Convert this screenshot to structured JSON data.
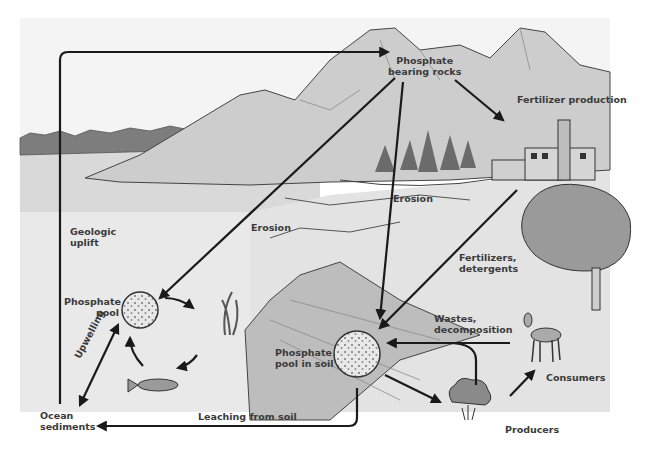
{
  "colors": {
    "sky": "#f3f3f3",
    "water": "#dcdcdc",
    "land": "#e6e6e6",
    "mountain": "#cfcfcf",
    "forest": "#7a7a7a",
    "arrow": "#1a1a1a",
    "text": "#3a3a3a"
  },
  "labels": {
    "phosphate_rocks": "Phosphate\nbearing rocks",
    "phosphate_rocks_l1": "Phosphate",
    "phosphate_rocks_l2": "bearing rocks",
    "fertilizer_production": "Fertilizer production",
    "erosion_left": "Erosion",
    "erosion_center": "Erosion",
    "geologic_uplift_l1": "Geologic",
    "geologic_uplift_l2": "uplift",
    "fertilizers_l1": "Fertilizers,",
    "fertilizers_l2": "detergents",
    "phosphate_pool_l1": "Phosphate",
    "phosphate_pool_l2": "pool",
    "phosphate_soil_l1": "Phosphate",
    "phosphate_soil_l2": "pool in soil",
    "wastes_l1": "Wastes,",
    "wastes_l2": "decomposition",
    "consumers": "Consumers",
    "producers": "Producers",
    "upwelling": "Upwelling",
    "ocean_sediments_l1": "Ocean",
    "ocean_sediments_l2": "sediments",
    "leaching": "Leaching from soil"
  },
  "nodes": [
    {
      "id": "phosphate_rocks",
      "label": "Phosphate bearing rocks"
    },
    {
      "id": "fertilizer_production",
      "label": "Fertilizer production"
    },
    {
      "id": "phosphate_pool",
      "label": "Phosphate pool"
    },
    {
      "id": "phosphate_pool_soil",
      "label": "Phosphate pool in soil"
    },
    {
      "id": "producers",
      "label": "Producers"
    },
    {
      "id": "consumers",
      "label": "Consumers"
    },
    {
      "id": "ocean_sediments",
      "label": "Ocean sediments"
    }
  ],
  "edges": [
    {
      "from": "ocean_sediments",
      "to": "phosphate_rocks",
      "label": "Geologic uplift"
    },
    {
      "from": "phosphate_rocks",
      "to": "phosphate_pool",
      "label": "Erosion"
    },
    {
      "from": "phosphate_rocks",
      "to": "phosphate_pool_soil",
      "label": "Erosion"
    },
    {
      "from": "phosphate_rocks",
      "to": "fertilizer_production",
      "label": ""
    },
    {
      "from": "fertilizer_production",
      "to": "phosphate_pool_soil",
      "label": "Fertilizers, detergents"
    },
    {
      "from": "phosphate_pool_soil",
      "to": "producers",
      "label": ""
    },
    {
      "from": "producers",
      "to": "consumers",
      "label": ""
    },
    {
      "from": "producers",
      "to": "phosphate_pool_soil",
      "label": "Wastes, decomposition"
    },
    {
      "from": "phosphate_pool_soil",
      "to": "ocean_sediments",
      "label": "Leaching from soil"
    },
    {
      "from": "phosphate_pool",
      "to": "ocean_sediments",
      "label": "Upwelling"
    },
    {
      "from": "ocean_sediments",
      "to": "phosphate_pool",
      "label": "Upwelling"
    },
    {
      "from": "phosphate_pool",
      "to": "seaweed",
      "label": ""
    },
    {
      "from": "seaweed",
      "to": "fish",
      "label": ""
    },
    {
      "from": "fish",
      "to": "phosphate_pool",
      "label": ""
    }
  ]
}
